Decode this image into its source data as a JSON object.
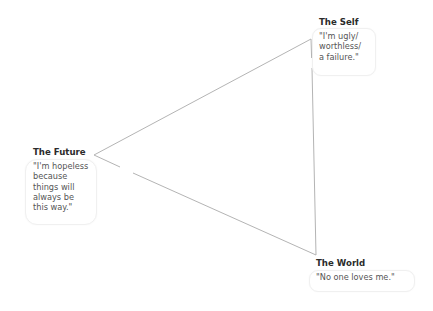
{
  "diagram": {
    "type": "cognitive-triad",
    "colors": {
      "line": "#b4b4b4",
      "title": "#2b2b2b",
      "quote": "#555555",
      "bubble_border": "#f0f0f0"
    },
    "vertices": {
      "self": {
        "x": 311,
        "y": 39
      },
      "future": {
        "x": 94,
        "y": 155
      },
      "world": {
        "x": 316,
        "y": 255
      }
    },
    "nodes": {
      "self": {
        "title": "The Self",
        "quote": "\"I'm ugly/\nworthless/\na failure.\""
      },
      "future": {
        "title": "The Future",
        "quote": "\"I'm hopeless\nbecause\nthings will\nalways be\nthis way.\""
      },
      "world": {
        "title": "The World",
        "quote": "\"No one loves me.\""
      }
    }
  }
}
